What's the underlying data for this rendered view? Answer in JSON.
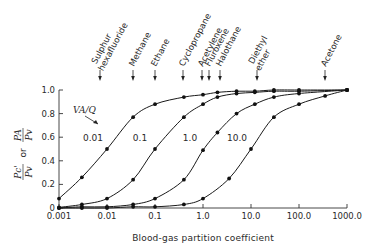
{
  "chart_data": {
    "type": "line",
    "title": "",
    "xlabel": "Blood-gas partition coefficient",
    "ylabel": "Pc'/Pv or PA/Pv",
    "ylabel_parts": {
      "num1": "Pc'",
      "den1": "Pv",
      "or": "or",
      "num2": "PA",
      "den2": "Pv"
    },
    "xscale": "log",
    "xlim": [
      0.001,
      1000.0
    ],
    "ylim": [
      0,
      1.0
    ],
    "x_ticks": [
      "0.001",
      "0.01",
      "0.1",
      "1.0",
      "10.0",
      "100.0",
      "1000.0"
    ],
    "y_ticks": [
      "0",
      "0.2",
      "0.4",
      "0.6",
      "0.8",
      "1.0"
    ],
    "grid": false,
    "legend_title": "VA/Q",
    "series": [
      {
        "name": "0.01",
        "x": [
          0.001,
          0.003,
          0.01,
          0.035,
          0.1,
          0.4,
          1.0,
          2.0,
          5.0,
          12.0,
          30.0,
          100.0,
          1000.0
        ],
        "values": [
          0.08,
          0.26,
          0.5,
          0.77,
          0.88,
          0.94,
          0.96,
          0.98,
          0.99,
          0.99,
          1.0,
          1.0,
          1.0
        ]
      },
      {
        "name": "0.1",
        "x": [
          0.001,
          0.003,
          0.01,
          0.035,
          0.1,
          0.4,
          1.0,
          2.0,
          5.0,
          12.0,
          30.0,
          100.0,
          1000.0
        ],
        "values": [
          0.005,
          0.03,
          0.08,
          0.24,
          0.5,
          0.77,
          0.88,
          0.94,
          0.97,
          0.98,
          0.99,
          0.99,
          1.0
        ]
      },
      {
        "name": "1.0",
        "x": [
          0.001,
          0.003,
          0.01,
          0.035,
          0.1,
          0.4,
          1.0,
          2.0,
          5.0,
          12.0,
          30.0,
          100.0,
          1000.0
        ],
        "values": [
          0.0,
          0.01,
          0.01,
          0.03,
          0.08,
          0.24,
          0.49,
          0.64,
          0.8,
          0.88,
          0.94,
          0.97,
          1.0
        ]
      },
      {
        "name": "10.0",
        "x": [
          0.001,
          0.003,
          0.01,
          0.035,
          0.1,
          0.4,
          1.0,
          3.5,
          10.0,
          30.0,
          100.0,
          350.0,
          1000.0
        ],
        "values": [
          0.0,
          0.0,
          0.0,
          0.01,
          0.01,
          0.03,
          0.08,
          0.25,
          0.5,
          0.77,
          0.88,
          0.95,
          1.0
        ]
      }
    ],
    "annotations": [
      {
        "label": "Sulphur hexafluoride",
        "x": 0.005
      },
      {
        "label": "Methane",
        "x": 0.032
      },
      {
        "label": "Ethane",
        "x": 0.09
      },
      {
        "label": "Cyclopropane",
        "x": 0.35
      },
      {
        "label": "Acetylene",
        "x": 0.9
      },
      {
        "label": "Fluroxene",
        "x": 1.3
      },
      {
        "label": "Halothane",
        "x": 2.3
      },
      {
        "label": "Diethyl ether",
        "x": 12.0
      },
      {
        "label": "Acetone",
        "x": 300.0
      }
    ]
  }
}
